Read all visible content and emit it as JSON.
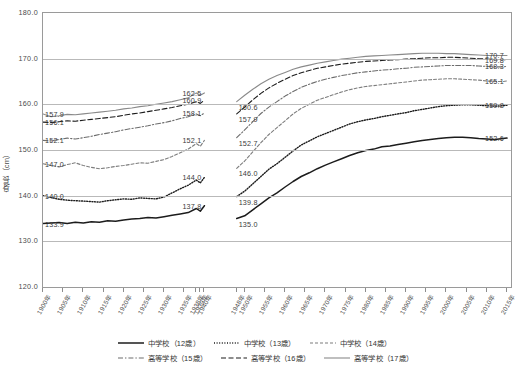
{
  "chart_data": {
    "type": "line",
    "title": "",
    "xlabel": "",
    "ylabel": "身長（cm）",
    "ylim": [
      120.0,
      180.0
    ],
    "ytick_labels": [
      "180.0",
      "170.0",
      "160.0",
      "150.0",
      "140.0",
      "130.0",
      "120.0"
    ],
    "ytick_values": [
      180.0,
      170.0,
      160.0,
      150.0,
      140.0,
      130.0,
      120.0
    ],
    "grid": true,
    "legend_position": "bottom",
    "xlim": [
      1900,
      2016
    ],
    "x_tick_labels": [
      "1900年",
      "1905年",
      "1910年",
      "1915年",
      "1920年",
      "1925年",
      "1930年",
      "1935年",
      "1938年",
      "1939年",
      "1940年",
      "1948年",
      "1950年",
      "1955年",
      "1960年",
      "1965年",
      "1970年",
      "1975年",
      "1980年",
      "1985年",
      "1990年",
      "1995年",
      "2000年",
      "2005年",
      "2010年",
      "2015年"
    ],
    "x_tick_years": [
      1900,
      1905,
      1910,
      1915,
      1920,
      1925,
      1930,
      1935,
      1938,
      1939,
      1940,
      1948,
      1950,
      1955,
      1960,
      1965,
      1970,
      1975,
      1980,
      1985,
      1990,
      1995,
      2000,
      2005,
      2010,
      2015
    ],
    "data_gap": {
      "from": 1940,
      "to": 1948
    },
    "series": [
      {
        "name": "中学校（12歳）",
        "style": "solid-thick",
        "color": "#1c1c1c",
        "x": [
          1900,
          1902,
          1904,
          1906,
          1908,
          1910,
          1912,
          1914,
          1916,
          1918,
          1920,
          1922,
          1924,
          1926,
          1928,
          1930,
          1932,
          1934,
          1936,
          1938,
          1939,
          1940,
          1948,
          1950,
          1952,
          1954,
          1956,
          1958,
          1960,
          1962,
          1964,
          1966,
          1968,
          1970,
          1972,
          1974,
          1976,
          1978,
          1980,
          1982,
          1984,
          1986,
          1988,
          1990,
          1992,
          1994,
          1996,
          1998,
          2000,
          2002,
          2004,
          2006,
          2008,
          2010,
          2012,
          2014,
          2015
        ],
        "y": [
          133.9,
          134.0,
          134.1,
          133.9,
          134.2,
          134.0,
          134.3,
          134.2,
          134.5,
          134.4,
          134.7,
          134.9,
          135.0,
          135.2,
          135.1,
          135.4,
          135.7,
          136.0,
          136.3,
          137.2,
          136.6,
          137.8,
          135.0,
          135.6,
          136.9,
          138.2,
          139.5,
          140.6,
          141.9,
          143.1,
          144.2,
          145.0,
          145.9,
          146.7,
          147.4,
          148.1,
          148.8,
          149.4,
          149.9,
          150.2,
          150.7,
          150.9,
          151.2,
          151.5,
          151.8,
          152.1,
          152.3,
          152.5,
          152.7,
          152.8,
          152.8,
          152.7,
          152.5,
          152.4,
          152.3,
          152.5,
          152.6
        ]
      },
      {
        "name": "中学校（13歳）",
        "style": "dotted",
        "color": "#1c1c1c",
        "x": [
          1900,
          1902,
          1904,
          1906,
          1908,
          1910,
          1912,
          1914,
          1916,
          1918,
          1920,
          1922,
          1924,
          1926,
          1928,
          1930,
          1932,
          1934,
          1936,
          1938,
          1939,
          1940,
          1948,
          1950,
          1952,
          1954,
          1956,
          1958,
          1960,
          1962,
          1964,
          1966,
          1968,
          1970,
          1972,
          1974,
          1976,
          1978,
          1980,
          1982,
          1984,
          1986,
          1988,
          1990,
          1992,
          1994,
          1996,
          1998,
          2000,
          2002,
          2004,
          2006,
          2008,
          2010,
          2012,
          2014,
          2015
        ],
        "y": [
          140.0,
          139.6,
          139.2,
          139.0,
          138.9,
          138.8,
          138.7,
          138.6,
          138.9,
          139.1,
          139.3,
          139.2,
          139.5,
          139.4,
          139.3,
          139.7,
          140.6,
          141.5,
          142.3,
          143.4,
          142.8,
          144.0,
          139.8,
          141.0,
          142.6,
          144.2,
          145.8,
          147.0,
          148.4,
          149.8,
          151.1,
          152.0,
          152.9,
          153.6,
          154.3,
          155.0,
          155.7,
          156.2,
          156.6,
          156.9,
          157.3,
          157.6,
          157.9,
          158.2,
          158.6,
          158.9,
          159.2,
          159.5,
          159.7,
          159.8,
          159.9,
          159.9,
          159.8,
          159.7,
          159.6,
          159.7,
          159.8
        ]
      },
      {
        "name": "中学校（14歳）",
        "style": "dashed-short",
        "color": "#7d7d7d",
        "x": [
          1900,
          1902,
          1904,
          1906,
          1908,
          1910,
          1912,
          1914,
          1916,
          1918,
          1920,
          1922,
          1924,
          1926,
          1928,
          1930,
          1932,
          1934,
          1936,
          1938,
          1939,
          1940,
          1948,
          1950,
          1952,
          1954,
          1956,
          1958,
          1960,
          1962,
          1964,
          1966,
          1968,
          1970,
          1972,
          1974,
          1976,
          1978,
          1980,
          1982,
          1984,
          1986,
          1988,
          1990,
          1992,
          1994,
          1996,
          1998,
          2000,
          2002,
          2004,
          2006,
          2008,
          2010,
          2012,
          2014,
          2015
        ],
        "y": [
          147.0,
          146.6,
          146.3,
          146.8,
          147.2,
          146.6,
          146.2,
          145.9,
          146.1,
          146.4,
          146.6,
          146.9,
          147.2,
          147.1,
          147.5,
          147.9,
          148.6,
          149.4,
          150.2,
          151.4,
          150.8,
          152.1,
          146.0,
          147.6,
          149.6,
          151.6,
          153.4,
          154.9,
          156.4,
          157.9,
          159.1,
          160.0,
          160.9,
          161.5,
          162.1,
          162.7,
          163.2,
          163.6,
          163.9,
          164.1,
          164.3,
          164.5,
          164.7,
          164.9,
          165.1,
          165.3,
          165.4,
          165.5,
          165.6,
          165.6,
          165.5,
          165.4,
          165.3,
          165.1,
          165.0,
          165.0,
          165.1
        ]
      },
      {
        "name": "高等学校（15歳）",
        "style": "dash-dot",
        "color": "#6d6d6d",
        "x": [
          1900,
          1902,
          1904,
          1906,
          1908,
          1910,
          1912,
          1914,
          1916,
          1918,
          1920,
          1922,
          1924,
          1926,
          1928,
          1930,
          1932,
          1934,
          1936,
          1938,
          1939,
          1940,
          1948,
          1950,
          1952,
          1954,
          1956,
          1958,
          1960,
          1962,
          1964,
          1966,
          1968,
          1970,
          1972,
          1974,
          1976,
          1978,
          1980,
          1982,
          1984,
          1986,
          1988,
          1990,
          1992,
          1994,
          1996,
          1998,
          2000,
          2002,
          2004,
          2006,
          2008,
          2010,
          2012,
          2014,
          2015
        ],
        "y": [
          152.1,
          152.0,
          152.3,
          152.6,
          152.4,
          152.7,
          153.0,
          153.4,
          153.7,
          154.0,
          154.4,
          154.7,
          155.0,
          155.3,
          155.7,
          156.0,
          156.4,
          156.9,
          157.3,
          157.9,
          157.5,
          158.1,
          152.7,
          154.4,
          156.2,
          158.0,
          159.4,
          160.6,
          161.8,
          162.8,
          163.7,
          164.4,
          165.0,
          165.5,
          165.9,
          166.3,
          166.6,
          166.9,
          167.1,
          167.3,
          167.5,
          167.6,
          167.8,
          167.9,
          168.1,
          168.2,
          168.3,
          168.4,
          168.5,
          168.5,
          168.5,
          168.5,
          168.4,
          168.3,
          168.2,
          168.2,
          168.3
        ]
      },
      {
        "name": "高等学校（16歳）",
        "style": "dashed-long",
        "color": "#1c1c1c",
        "x": [
          1900,
          1902,
          1904,
          1906,
          1908,
          1910,
          1912,
          1914,
          1916,
          1918,
          1920,
          1922,
          1924,
          1926,
          1928,
          1930,
          1932,
          1934,
          1936,
          1938,
          1939,
          1940,
          1948,
          1950,
          1952,
          1954,
          1956,
          1958,
          1960,
          1962,
          1964,
          1966,
          1968,
          1970,
          1972,
          1974,
          1976,
          1978,
          1980,
          1982,
          1984,
          1986,
          1988,
          1990,
          1992,
          1994,
          1996,
          1998,
          2000,
          2002,
          2004,
          2006,
          2008,
          2010,
          2012,
          2014,
          2015
        ],
        "y": [
          156.1,
          156.0,
          156.2,
          156.4,
          156.3,
          156.5,
          156.7,
          156.9,
          157.1,
          157.3,
          157.6,
          157.9,
          158.1,
          158.4,
          158.7,
          159.0,
          159.3,
          159.7,
          160.0,
          160.6,
          160.2,
          160.9,
          157.9,
          159.4,
          161.0,
          162.4,
          163.6,
          164.6,
          165.5,
          166.3,
          166.9,
          167.4,
          167.9,
          168.2,
          168.5,
          168.8,
          169.0,
          169.2,
          169.4,
          169.5,
          169.6,
          169.7,
          169.8,
          169.9,
          170.0,
          170.1,
          170.2,
          170.2,
          170.3,
          170.3,
          170.2,
          170.1,
          170.0,
          169.9,
          169.8,
          169.8,
          169.8
        ]
      },
      {
        "name": "高等学校（17歳）",
        "style": "solid-thin",
        "color": "#8a8a8a",
        "x": [
          1900,
          1902,
          1904,
          1906,
          1908,
          1910,
          1912,
          1914,
          1916,
          1918,
          1920,
          1922,
          1924,
          1926,
          1928,
          1930,
          1932,
          1934,
          1936,
          1938,
          1939,
          1940,
          1948,
          1950,
          1952,
          1954,
          1956,
          1958,
          1960,
          1962,
          1964,
          1966,
          1968,
          1970,
          1972,
          1974,
          1976,
          1978,
          1980,
          1982,
          1984,
          1986,
          1988,
          1990,
          1992,
          1994,
          1996,
          1998,
          2000,
          2002,
          2004,
          2006,
          2008,
          2010,
          2012,
          2014,
          2015
        ],
        "y": [
          157.9,
          157.3,
          157.5,
          157.8,
          157.7,
          157.9,
          158.1,
          158.3,
          158.5,
          158.7,
          159.0,
          159.2,
          159.5,
          159.7,
          160.0,
          160.3,
          160.6,
          161.0,
          161.4,
          162.5,
          162.0,
          162.5,
          160.6,
          162.0,
          163.3,
          164.5,
          165.5,
          166.3,
          167.0,
          167.7,
          168.2,
          168.6,
          169.0,
          169.3,
          169.6,
          169.9,
          170.1,
          170.3,
          170.5,
          170.6,
          170.7,
          170.8,
          170.9,
          171.0,
          171.1,
          171.2,
          171.2,
          171.2,
          171.1,
          171.1,
          171.0,
          170.9,
          170.8,
          170.7,
          170.7,
          170.7,
          170.7
        ]
      }
    ],
    "annotations": {
      "left_edge": [
        {
          "value": "157.9",
          "series": "高等学校（17歳）"
        },
        {
          "value": "156.1",
          "series": "高等学校（16歳）"
        },
        {
          "value": "152.1",
          "series": "高等学校（15歳）"
        },
        {
          "value": "147.0",
          "series": "中学校（14歳）"
        },
        {
          "value": "140.0",
          "series": "中学校（13歳）"
        },
        {
          "value": "133.9",
          "series": "中学校（12歳）"
        }
      ],
      "pre_gap": [
        {
          "value": "162.5",
          "series": "高等学校（17歳）"
        },
        {
          "value": "160.9",
          "series": "高等学校（16歳）"
        },
        {
          "value": "158.1",
          "series": "高等学校（15歳）"
        },
        {
          "value": "152.1",
          "series": "中学校（14歳）"
        },
        {
          "value": "144.0",
          "series": "中学校（13歳）"
        },
        {
          "value": "137.8",
          "series": "中学校（12歳）"
        }
      ],
      "post_gap": [
        {
          "value": "160.6",
          "series": "高等学校（17歳）"
        },
        {
          "value": "157.9",
          "series": "高等学校（16歳）"
        },
        {
          "value": "152.7",
          "series": "高等学校（15歳）"
        },
        {
          "value": "146.0",
          "series": "中学校（14歳）"
        },
        {
          "value": "139.8",
          "series": "中学校（13歳）"
        },
        {
          "value": "135.0",
          "series": "中学校（12歳）"
        }
      ],
      "right_edge": [
        {
          "value": "170.7",
          "series": "高等学校（17歳）"
        },
        {
          "value": "169.8",
          "series": "高等学校（16歳）"
        },
        {
          "value": "168.3",
          "series": "高等学校（15歳）"
        },
        {
          "value": "165.1",
          "series": "中学校（14歳）"
        },
        {
          "value": "159.8",
          "series": "中学校（13歳）"
        },
        {
          "value": "152.6",
          "series": "中学校（12歳）"
        }
      ]
    }
  },
  "legend": {
    "rows": [
      [
        {
          "label": "中学校（12歳）",
          "style": "solid-thick",
          "color": "#1c1c1c"
        },
        {
          "label": "中学校（13歳）",
          "style": "dotted",
          "color": "#1c1c1c"
        },
        {
          "label": "中学校（14歳）",
          "style": "dashed-short",
          "color": "#7d7d7d"
        }
      ],
      [
        {
          "label": "高等学校（15歳）",
          "style": "dash-dot",
          "color": "#6d6d6d"
        },
        {
          "label": "高等学校（16歳）",
          "style": "dashed-long",
          "color": "#1c1c1c"
        },
        {
          "label": "高等学校（17歳）",
          "style": "solid-thin",
          "color": "#8a8a8a"
        }
      ]
    ]
  },
  "colors": {
    "frame": "#9a9a9a",
    "grid": "#b9b9b9",
    "text": "#4a4a4a",
    "background": "#ffffff"
  }
}
